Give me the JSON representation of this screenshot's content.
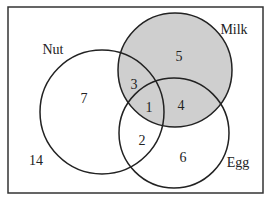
{
  "diagram": {
    "type": "venn",
    "sets": [
      {
        "name": "Nut",
        "cx": 102,
        "cy": 112,
        "r": 62
      },
      {
        "name": "Milk",
        "cx": 175,
        "cy": 70,
        "r": 57,
        "shaded": true
      },
      {
        "name": "Egg",
        "cx": 174,
        "cy": 133,
        "r": 55
      }
    ],
    "shade_color": "#cfcfcf",
    "labels": {
      "nut": "Nut",
      "milk": "Milk",
      "egg": "Egg"
    },
    "regions": {
      "nut_only": "7",
      "milk_only": "5",
      "egg_only": "6",
      "nut_milk": "3",
      "nut_egg": "2",
      "milk_egg": "4",
      "all_three": "1",
      "outside": "14"
    }
  }
}
